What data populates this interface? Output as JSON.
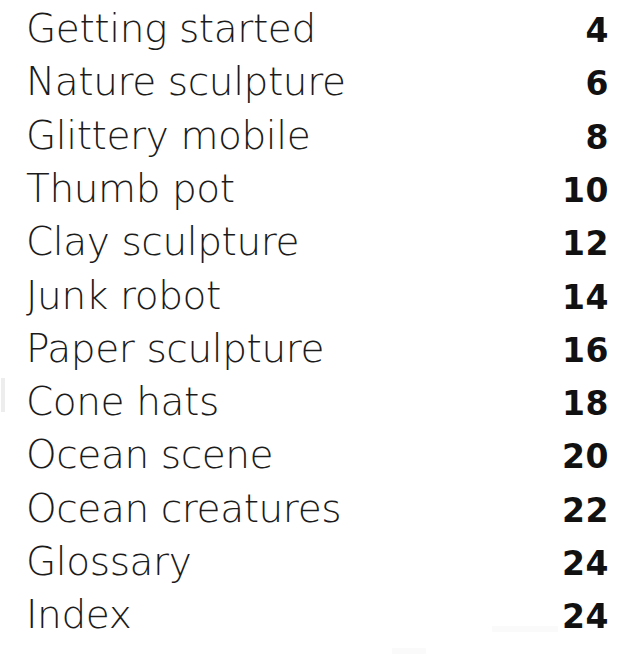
{
  "page": {
    "kind": "table-of-contents",
    "background_color": "#ffffff",
    "title_color": "#1b1b1b",
    "number_color": "#111111"
  },
  "contents": {
    "entries": [
      {
        "title": "Getting started",
        "page": "4"
      },
      {
        "title": "Nature sculpture",
        "page": "6"
      },
      {
        "title": "Glittery mobile",
        "page": "8"
      },
      {
        "title": "Thumb pot",
        "page": "10"
      },
      {
        "title": "Clay sculpture",
        "page": "12"
      },
      {
        "title": "Junk robot",
        "page": "14"
      },
      {
        "title": "Paper sculpture",
        "page": "16"
      },
      {
        "title": "Cone hats",
        "page": "18"
      },
      {
        "title": "Ocean scene",
        "page": "20"
      },
      {
        "title": "Ocean creatures",
        "page": "22"
      },
      {
        "title": "Glossary",
        "page": "24"
      },
      {
        "title": "Index",
        "page": "24"
      }
    ]
  },
  "layout": {
    "first_baseline_y": 40,
    "row_pitch": 53.3,
    "text_left_x": 26,
    "number_right_x": 609
  }
}
